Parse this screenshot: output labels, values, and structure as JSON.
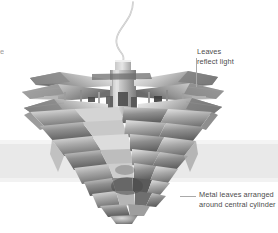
{
  "canvas": {
    "width": 278,
    "height": 233,
    "background_color": "#ffffff",
    "band_color": "#e9e9e9"
  },
  "subject": {
    "name": "pendant-lamp",
    "description": "Artichoke-style pendant lamp with overlapping metal leaves suspended by a cord",
    "palette": {
      "metal_light": "#dedede",
      "metal_mid": "#b4b4b4",
      "metal_dark": "#8a8a8a",
      "metal_shadow": "#646464",
      "cord": "#bdbdbd"
    }
  },
  "annotations": [
    {
      "id": "leaves-reflect-light",
      "lines": [
        "Leaves",
        "reflect light"
      ],
      "leader": "vertical",
      "color": "#4c4c4c"
    },
    {
      "id": "metal-leaves-cylinder",
      "lines": [
        "Metal leaves arranged",
        "around central cylinder"
      ],
      "leader": "horizontal",
      "color": "#4c4c4c"
    }
  ],
  "edge_fragment": "e"
}
